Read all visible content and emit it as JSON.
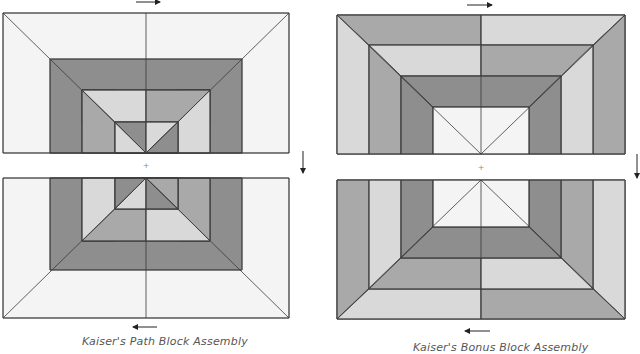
{
  "colors": {
    "background": "#ffffff",
    "white_fabric": "#f4f4f4",
    "light_fabric": "#d9d9d9",
    "medium_fabric": "#a9a9a9",
    "dark_fabric": "#8e8e8e",
    "seam": "#3a3a3a",
    "arrow": "#222222"
  },
  "diagrams": [
    {
      "id": "kaisers-path",
      "caption": "Kaiser's Path Block Assembly",
      "arrows": [
        "right",
        "down",
        "left"
      ]
    },
    {
      "id": "kaisers-bonus",
      "caption": "Kaiser's Bonus Block Assembly",
      "arrows": [
        "right",
        "down",
        "left"
      ]
    }
  ],
  "center_marker": "+"
}
